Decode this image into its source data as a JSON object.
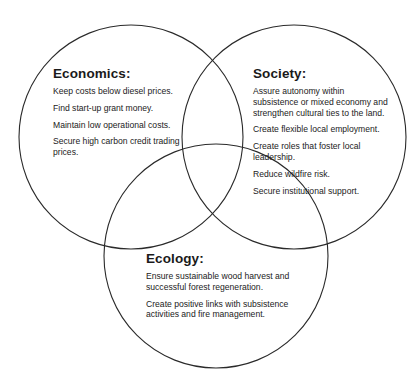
{
  "diagram": {
    "type": "venn",
    "stroke_color": "#2a2a2a",
    "background": "#ffffff",
    "circles": [
      {
        "id": "economics",
        "cx": 131,
        "cy": 137,
        "r": 112
      },
      {
        "id": "society",
        "cx": 294,
        "cy": 137,
        "r": 112
      },
      {
        "id": "ecology",
        "cx": 216,
        "cy": 256,
        "r": 112
      }
    ]
  },
  "sets": {
    "economics": {
      "title": "Economics:",
      "items": [
        "Keep costs below diesel prices.",
        "Find start-up grant money.",
        "Maintain low operational costs.",
        "Secure high carbon credit trading prices."
      ]
    },
    "society": {
      "title": "Society:",
      "items": [
        "Assure autonomy within subsistence or mixed economy and strengthen cultural ties to the land.",
        "Create flexible local employment.",
        "Create roles that foster local leadership.",
        "Reduce wildfire risk.",
        "Secure institutional support."
      ]
    },
    "ecology": {
      "title": "Ecology:",
      "items": [
        "Ensure sustainable wood harvest and successful forest regeneration.",
        "Create positive links with subsistence activities and fire management."
      ]
    }
  }
}
